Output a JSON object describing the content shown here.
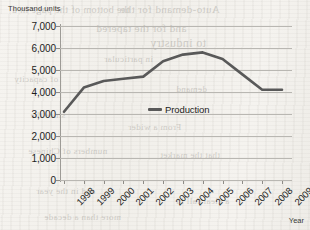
{
  "chart_data": {
    "type": "line",
    "title": "",
    "subtitle": "",
    "xlabel": "Year",
    "ylabel": "Thousand units",
    "categories": [
      "1998",
      "1999",
      "2000",
      "2001",
      "2002",
      "2003",
      "2004",
      "2005",
      "2006",
      "2007",
      "2008",
      "2009"
    ],
    "series": [
      {
        "name": "Production",
        "color": "#595959",
        "values": [
          3100,
          4200,
          4500,
          4600,
          4700,
          5400,
          5700,
          5800,
          5500,
          4800,
          4100,
          4100
        ]
      }
    ],
    "ylim": [
      0,
      7000
    ],
    "y_ticks": [
      "7,000",
      "6,000",
      "5,000",
      "4,000",
      "3,000",
      "2,000",
      "1,000",
      "0"
    ],
    "y_tick_values": [
      7000,
      6000,
      5000,
      4000,
      3000,
      2000,
      1000,
      0
    ],
    "grid": true,
    "grid_axis": "y",
    "legend_position": "inside-center",
    "legend_entries": [
      "Production"
    ],
    "axis_colors": {
      "grid": "#b9b7b2",
      "axis": "#9d9b96",
      "text": "#1d1d1c"
    }
  },
  "ghost_text": [
    {
      "text": "the bottom of the page in a",
      "x": 12,
      "y": 4,
      "size": 10
    },
    {
      "text": "Auto-demand for the",
      "x": 120,
      "y": 3,
      "size": 11
    },
    {
      "text": "and for the tapered",
      "x": 96,
      "y": 22,
      "size": 11
    },
    {
      "text": "to industry",
      "x": 150,
      "y": 36,
      "size": 12
    },
    {
      "text": "in particular",
      "x": 104,
      "y": 54,
      "size": 9
    },
    {
      "text": "of capacity",
      "x": 14,
      "y": 74,
      "size": 9
    },
    {
      "text": "demand",
      "x": 176,
      "y": 84,
      "size": 9
    },
    {
      "text": "since the",
      "x": 30,
      "y": 110,
      "size": 9
    },
    {
      "text": "From a wider",
      "x": 128,
      "y": 122,
      "size": 9
    },
    {
      "text": "numbers of Chinese",
      "x": 28,
      "y": 146,
      "size": 9
    },
    {
      "text": "that the market",
      "x": 160,
      "y": 150,
      "size": 9
    },
    {
      "text": "and in the year",
      "x": 36,
      "y": 186,
      "size": 9
    },
    {
      "text": "a clear fall in",
      "x": 176,
      "y": 196,
      "size": 9
    },
    {
      "text": "more than a decade",
      "x": 44,
      "y": 212,
      "size": 9
    }
  ]
}
